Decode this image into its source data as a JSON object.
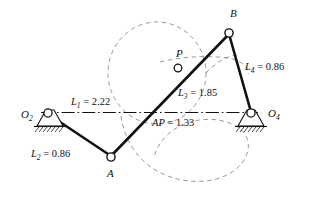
{
  "figure": {
    "type": "fourbar-linkage-diagram",
    "background_color": "#ffffff",
    "line_color": "#111111",
    "dashed_color": "#8a8a8a"
  },
  "points": {
    "O2": {
      "label": "O",
      "subscript": "2",
      "x": 46,
      "y": 113
    },
    "O4": {
      "label": "O",
      "subscript": "4",
      "x": 252,
      "y": 113
    },
    "A": {
      "label": "A",
      "subscript": "",
      "x": 111,
      "y": 156
    },
    "B": {
      "label": "B",
      "subscript": "",
      "x": 229,
      "y": 33
    },
    "P": {
      "label": "P",
      "subscript": "",
      "x": 178,
      "y": 68
    }
  },
  "labels": {
    "O2": "O",
    "O2_sub": "2",
    "O4": "O",
    "O4_sub": "4",
    "A": "A",
    "B": "B",
    "P": "P",
    "L1": "L",
    "L1_sub": "1",
    "L1_value": " = 2.22",
    "L2": "L",
    "L2_sub": "2",
    "L2_value": " = 0.86",
    "L3": "L",
    "L3_sub": "3",
    "L3_value": " = 1.85",
    "L4": "L",
    "L4_sub": "4",
    "L4_value": " = 0.86",
    "AP": "AP",
    "AP_value": " = 1.33"
  },
  "dimensions": {
    "L1": 2.22,
    "L2": 0.86,
    "L3": 1.85,
    "L4": 0.86,
    "AP": 1.33
  },
  "links": [
    {
      "name": "ground-link-L1",
      "from": "O2",
      "to": "O4",
      "style": "dash-dot"
    },
    {
      "name": "crank-link-L2",
      "from": "O2",
      "to": "A",
      "style": "solid"
    },
    {
      "name": "coupler-link-L3",
      "from": "A",
      "to": "B",
      "style": "solid"
    },
    {
      "name": "rocker-link-L4",
      "from": "B",
      "to": "O4",
      "style": "solid"
    }
  ],
  "curves": [
    {
      "name": "coupler-circle-dashed",
      "style": "dashed"
    },
    {
      "name": "coupler-curve-dashed",
      "style": "dashed"
    },
    {
      "name": "coupler-arc-dashed",
      "style": "dashed"
    }
  ]
}
